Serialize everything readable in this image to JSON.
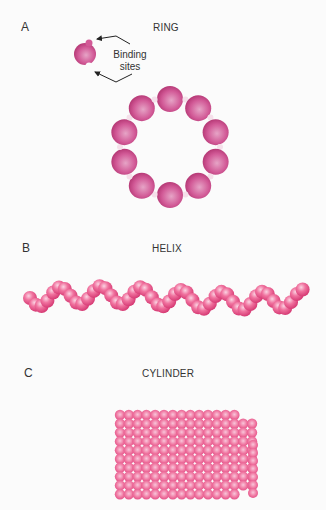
{
  "panels": {
    "a": {
      "letter": "A",
      "title": "RING",
      "annotation_line1": "Binding",
      "annotation_line2": "sites",
      "subunit_count": 10
    },
    "b": {
      "letter": "B",
      "title": "HELIX"
    },
    "c": {
      "letter": "C",
      "title": "CYLINDER"
    }
  },
  "colors": {
    "subunit": "#d9478a",
    "helix_sphere": "#ec5f91",
    "cylinder_sphere": "#ee6797",
    "text": "#333333"
  }
}
